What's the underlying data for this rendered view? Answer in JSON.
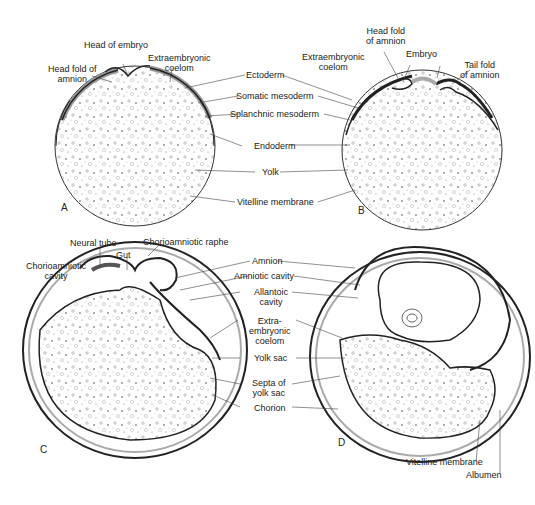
{
  "figure": {
    "panels": [
      {
        "id": "A",
        "letter": "A"
      },
      {
        "id": "B",
        "letter": "B"
      },
      {
        "id": "C",
        "letter": "C"
      },
      {
        "id": "D",
        "letter": "D"
      }
    ]
  },
  "labels": {
    "a_head_of_embryo": "Head of embryo",
    "a_head_fold": "Head fold of\namnion",
    "a_extraembryonic_coelom": "Extraembryonic\ncoelom",
    "mid_ectoderm": "Ectoderm",
    "mid_somatic_mesoderm": "Somatic mesoderm",
    "mid_splanchnic_mesoderm": "Splanchnic mesoderm",
    "mid_endoderm": "Endoderm",
    "mid_yolk": "Yolk",
    "mid_vitelline_membrane": "Vitelline membrane",
    "b_head_fold": "Head fold\nof amnion",
    "b_extraembryonic_coelom": "Extraembryonic\ncoelom",
    "b_embryo": "Embryo",
    "b_tail_fold": "Tail fold\nof amnion",
    "c_neural_tube": "Neural tube",
    "c_gut": "Gut",
    "c_chorioamniotic_raphe": "Chorioamniotic raphe",
    "c_chorioamniotic_cavity": "Chorioamniotic\ncavity",
    "mid2_amnion": "Amnion",
    "mid2_amniotic_cavity": "Amniotic cavity",
    "mid2_allantoic_cavity": "Allantoic\ncavity",
    "mid2_extraembryonic_coelom": "Extra-\nembryonic\ncoelom",
    "mid2_yolk_sac": "Yolk sac",
    "mid2_septa": "Septa of\nyolk sac",
    "mid2_chorion": "Chorion",
    "d_vitelline_membrane": "Vitelline membrane",
    "d_albumen": "Albumen"
  }
}
